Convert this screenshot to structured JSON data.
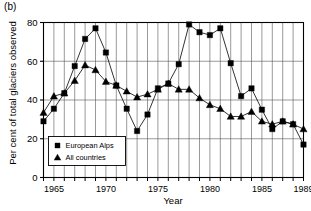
{
  "panel": {
    "label": "(b)"
  },
  "chart_data": {
    "type": "line",
    "title": "",
    "subtitle": "",
    "xlabel": "Year",
    "ylabel": "Per cent of total glaciers observed",
    "xlim": [
      1964,
      1989
    ],
    "ylim": [
      0,
      80
    ],
    "yticks": [
      0,
      20,
      40,
      60,
      80
    ],
    "ytick_labels": [
      "0",
      "20",
      "40",
      "60",
      "80"
    ],
    "xticks": [
      1965,
      1970,
      1975,
      1980,
      1985,
      1989
    ],
    "xtick_labels": [
      "1965",
      "1970",
      "1975",
      "1980",
      "1985",
      "1989"
    ],
    "x_minor_interval": 1,
    "grid": "vertical gridlines every year, horizontal gridlines at each y tick",
    "legend_position": "lower-left inside axes",
    "x": [
      1964,
      1965,
      1966,
      1967,
      1968,
      1969,
      1970,
      1971,
      1972,
      1973,
      1974,
      1975,
      1976,
      1977,
      1978,
      1979,
      1980,
      1981,
      1982,
      1983,
      1984,
      1985,
      1986,
      1987,
      1988,
      1989
    ],
    "series": [
      {
        "name": "European Alps",
        "marker": "square",
        "color": "#000000",
        "values": [
          29,
          35.5,
          43.5,
          57.5,
          71.5,
          77,
          64.5,
          47.5,
          35.5,
          24,
          32.5,
          46,
          48.5,
          58.5,
          79,
          75,
          73.5,
          77,
          59,
          42,
          46,
          35,
          25,
          29,
          27.5,
          17
        ]
      },
      {
        "name": "All countries",
        "marker": "triangle",
        "color": "#000000",
        "values": [
          33.5,
          42,
          43.5,
          50,
          58,
          55.5,
          49.5,
          47.5,
          44.5,
          41.5,
          43,
          45.5,
          48.5,
          45.5,
          45.5,
          41,
          37.5,
          35.5,
          31.5,
          31.5,
          34,
          29,
          27.5,
          29,
          27.5,
          25
        ]
      }
    ]
  },
  "legend": {
    "items": [
      {
        "label": "European Alps",
        "marker": "square"
      },
      {
        "label": "All countries",
        "marker": "triangle"
      }
    ]
  }
}
